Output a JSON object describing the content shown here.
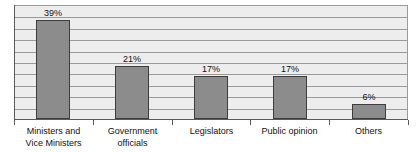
{
  "chart_data": {
    "type": "bar",
    "title": "",
    "subtitle": "",
    "xlabel": "",
    "ylabel": "",
    "ylim": [
      0,
      45
    ],
    "grid": true,
    "gridline_count": 9,
    "legend": "none",
    "orientation": "vertical",
    "value_labels_position": "above-bar",
    "categories": [
      "Ministers and\nVice Ministers",
      "Government\nofficials",
      "Legislators",
      "Public opinion",
      "Others"
    ],
    "values": [
      39,
      21,
      17,
      17,
      6
    ],
    "value_labels": [
      "39%",
      "21%",
      "17%",
      "17%",
      "6%"
    ],
    "colors": {
      "bar_fill": "#8c8c8c",
      "bar_border": "#3d3d3d",
      "plot_background": "#ededed",
      "gridline": "#9a9a9a",
      "axis": "#5a5a5a",
      "text": "#111111",
      "page_background": "#ffffff"
    }
  }
}
